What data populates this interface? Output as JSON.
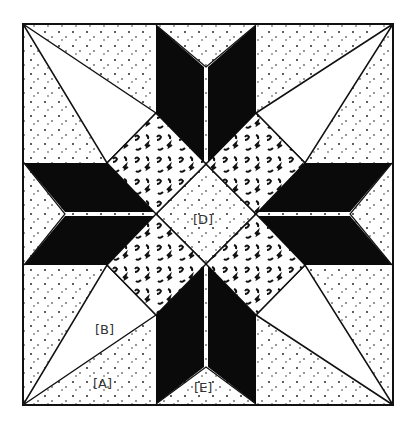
{
  "diagram": {
    "type": "quilt-block-pattern",
    "colors": {
      "background": "#ffffff",
      "ink": "#111111",
      "solid": "#0a0a0a",
      "label": "#333333"
    },
    "labels": {
      "A": "[A]",
      "B": "[B]",
      "D": "[D]",
      "E": "[E]"
    },
    "pieces": [
      {
        "id": "A",
        "description": "speckled corner triangle"
      },
      {
        "id": "B",
        "description": "plain kite triangle"
      },
      {
        "id": "D",
        "description": "speckled center diamond"
      },
      {
        "id": "E",
        "description": "speckled edge triangle between star points"
      }
    ]
  }
}
